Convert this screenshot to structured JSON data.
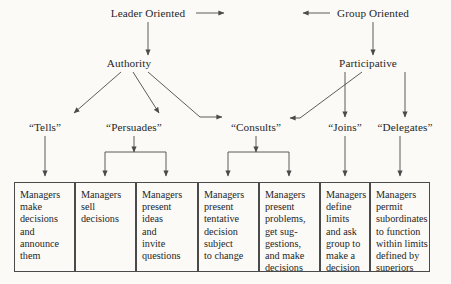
{
  "diagram": {
    "top_row": [
      {
        "id": "leader-oriented",
        "label": "Leader Oriented",
        "cx": 148,
        "y": 14
      },
      {
        "id": "group-oriented",
        "label": "Group Oriented",
        "cx": 373,
        "y": 14
      }
    ],
    "tier2": [
      {
        "id": "authority",
        "label": "Authority",
        "cx": 129,
        "y": 64
      },
      {
        "id": "participative",
        "label": "Participative",
        "cx": 368,
        "y": 64
      }
    ],
    "tier3": [
      {
        "id": "tells",
        "label": "“Tells”",
        "cx": 45,
        "y": 128
      },
      {
        "id": "persuades",
        "label": "“Persuades”",
        "cx": 134,
        "y": 128
      },
      {
        "id": "consults",
        "label": "“Consults”",
        "cx": 256,
        "y": 128
      },
      {
        "id": "joins",
        "label": "“Joins”",
        "cx": 345,
        "y": 128
      },
      {
        "id": "delegates",
        "label": "“Delegates”",
        "cx": 405,
        "y": 128
      }
    ],
    "boxes": [
      {
        "id": "box-1",
        "text": "Managers\nmake\ndecisions\nand\nannounce\nthem",
        "x": 14,
        "w": 61
      },
      {
        "id": "box-2",
        "text": "Managers\nsell\ndecisions",
        "x": 75,
        "w": 61
      },
      {
        "id": "box-3",
        "text": "Managers\npresent\nideas\nand\ninvite\nquestions",
        "x": 136,
        "w": 62
      },
      {
        "id": "box-4",
        "text": "Managers\npresent\ntentative\ndecision\nsubject\nto change",
        "x": 198,
        "w": 61
      },
      {
        "id": "box-5",
        "text": "Managers\npresent\nproblems,\nget sug-\ngestions,\nand make\ndecisions",
        "x": 259,
        "w": 61
      },
      {
        "id": "box-6",
        "text": "Managers\ndefine\nlimits\nand ask\ngroup to\nmake a\ndecision",
        "x": 320,
        "w": 50
      },
      {
        "id": "box-7",
        "text": "Managers\npermit\nsubordinates\nto function\nwithin limits\ndefined by\nsuperiors",
        "x": 370,
        "w": 60
      }
    ],
    "box_geometry": {
      "y": 182,
      "h": 90
    },
    "colors": {
      "stroke": "#4a4a4a",
      "text": "#262626",
      "background": "#fbfaf7"
    }
  }
}
